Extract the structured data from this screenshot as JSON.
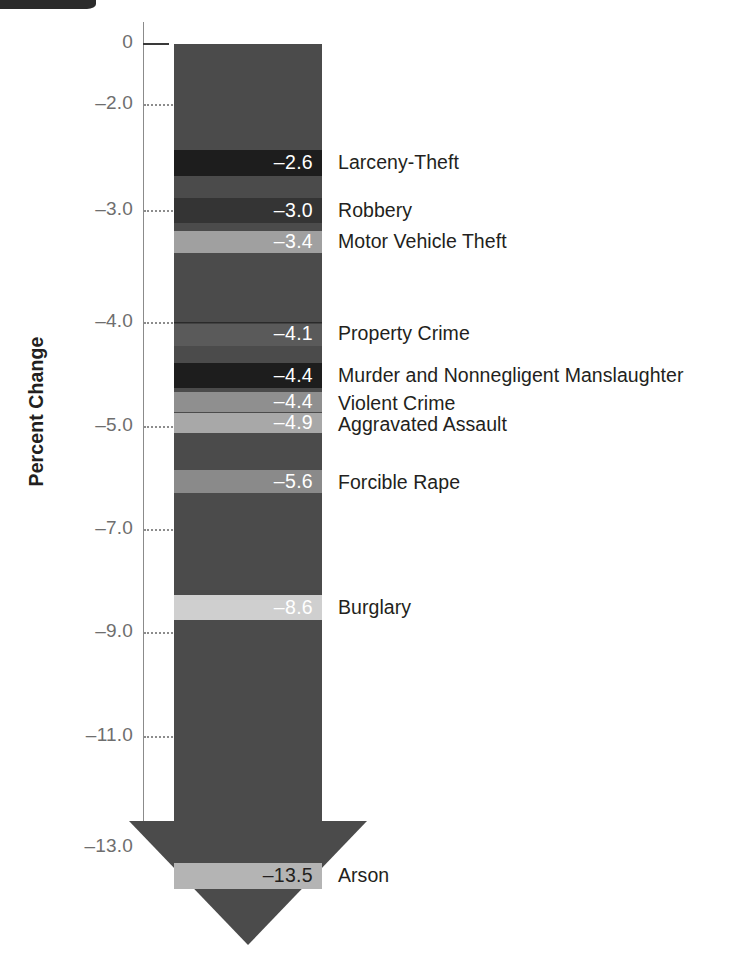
{
  "figure": {
    "axis_title": "Percent Change",
    "background": "#ffffff",
    "shaft_color": "#4b4b4b",
    "label_color": "#231f20",
    "tick_color": "#6e6e6e"
  },
  "chart_data": {
    "type": "bar",
    "title": "",
    "subtitle": "",
    "xlabel": "",
    "ylabel": "Percent Change",
    "ylim": [
      -13.5,
      0
    ],
    "grid": true,
    "legend_position": "right-inline",
    "orientation": "vertical-arrow",
    "categories": [
      "Larceny-Theft",
      "Robbery",
      "Motor Vehicle Theft",
      "Property Crime",
      "Murder and Nonnegligent Manslaughter",
      "Violent Crime",
      "Aggravated Assault",
      "Forcible Rape",
      "Burglary",
      "Arson"
    ],
    "values": [
      -2.6,
      -3.0,
      -3.4,
      -4.1,
      -4.4,
      -4.4,
      -4.9,
      -5.6,
      -8.6,
      -13.5
    ],
    "value_labels": [
      "–2.6",
      "–3.0",
      "–3.4",
      "–4.1",
      "–4.4",
      "–4.4",
      "–4.9",
      "–5.6",
      "–8.6",
      "–13.5"
    ],
    "yticks": [
      0,
      -2.0,
      -3.0,
      -4.0,
      -5.0,
      -7.0,
      -9.0,
      -11.0,
      -13.0
    ],
    "ytick_labels": [
      "0",
      "–2.0",
      "–3.0",
      "–4.0",
      "–5.0",
      "–7.0",
      "–9.0",
      "–11.0",
      "–13.0"
    ]
  },
  "y_ticks": [
    {
      "label": "0",
      "top": 44,
      "style": "solid"
    },
    {
      "label": "–2.0",
      "top": 105,
      "style": "dotted"
    },
    {
      "label": "–3.0",
      "top": 211,
      "style": "dotted"
    },
    {
      "label": "–4.0",
      "top": 323,
      "style": "dotted"
    },
    {
      "label": "–5.0",
      "top": 427,
      "style": "dotted"
    },
    {
      "label": "–7.0",
      "top": 530,
      "style": "dotted"
    },
    {
      "label": "–9.0",
      "top": 633,
      "style": "dotted"
    },
    {
      "label": "–11.0",
      "top": 737,
      "style": "dotted"
    },
    {
      "label": "–13.0",
      "top": 848,
      "style": "none"
    }
  ],
  "bands": [
    {
      "name": "larceny-theft",
      "value": "–2.6",
      "label": "Larceny-Theft",
      "top": 150,
      "height": 26,
      "color": "#1d1d1d",
      "value_color": "#ffffff",
      "label_top": 153,
      "topline": false
    },
    {
      "name": "robbery",
      "value": "–3.0",
      "label": "Robbery",
      "top": 198,
      "height": 25,
      "color": "#343434",
      "value_color": "#ffffff",
      "label_top": 201,
      "topline": false
    },
    {
      "name": "motor-vehicle-theft",
      "value": "–3.4",
      "label": "Motor Vehicle Theft",
      "top": 231,
      "height": 22,
      "color": "#a0a0a0",
      "value_color": "#ffffff",
      "label_top": 232,
      "topline": false
    },
    {
      "name": "property-crime",
      "value": "–4.1",
      "label": "Property Crime",
      "top": 322,
      "height": 24,
      "color": "#5a5a5a",
      "value_color": "#ffffff",
      "label_top": 324,
      "topline": true
    },
    {
      "name": "murder-nonnegligent-manslaughter",
      "value": "–4.4",
      "label": "Murder and Nonnegligent Manslaughter",
      "top": 363,
      "height": 25,
      "color": "#1d1d1d",
      "value_color": "#ffffff",
      "label_top": 366,
      "topline": false
    },
    {
      "name": "violent-crime",
      "value": "–4.4",
      "label": "Violent Crime",
      "top": 392,
      "height": 20,
      "color": "#8f8f8f",
      "value_color": "#ffffff",
      "label_top": 394,
      "topline": false
    },
    {
      "name": "aggravated-assault",
      "value": "–4.9",
      "label": "Aggravated Assault",
      "top": 413,
      "height": 20,
      "color": "#a8a8a8",
      "value_color": "#ffffff",
      "label_top": 415,
      "topline": false
    },
    {
      "name": "forcible-rape",
      "value": "–5.6",
      "label": "Forcible Rape",
      "top": 470,
      "height": 23,
      "color": "#8a8a8a",
      "value_color": "#ffffff",
      "label_top": 473,
      "topline": false
    },
    {
      "name": "burglary",
      "value": "–8.6",
      "label": "Burglary",
      "top": 595,
      "height": 25,
      "color": "#cfcfcf",
      "value_color": "#ffffff",
      "label_top": 598,
      "topline": false
    },
    {
      "name": "arson",
      "value": "–13.5",
      "label": "Arson",
      "top": 863,
      "height": 26,
      "color": "#b4b4b4",
      "value_color": "#231f20",
      "label_top": 866,
      "topline": false
    }
  ]
}
